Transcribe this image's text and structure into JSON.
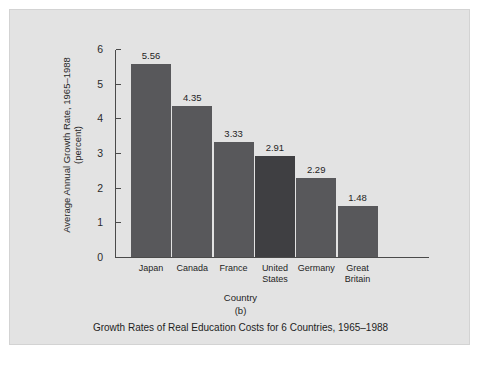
{
  "figure": {
    "panel_letter": "(b)",
    "caption": "Growth Rates of Real Education Costs for 6 Countries, 1965–1988",
    "background_color": "#e3e3e3",
    "page_color": "#ffffff"
  },
  "chart_data": {
    "type": "bar",
    "title": "Growth Rates of Real Education Costs for 6 Countries, 1965–1988",
    "subtitle": "(b)",
    "xlabel": "Country",
    "ylabel": "Average Annual Growth Rate, 1965–1988 (percent)",
    "ylabel_line1": "Average Annual Growth Rate, 1965–1988",
    "ylabel_line2": "(percent)",
    "categories": [
      "Japan",
      "Canada",
      "France",
      "United States",
      "Germany",
      "Great Britain"
    ],
    "values": [
      5.56,
      4.35,
      3.33,
      2.91,
      2.29,
      1.48
    ],
    "value_labels": [
      "5.56",
      "4.35",
      "3.33",
      "2.91",
      "2.29",
      "1.48"
    ],
    "category_lines": [
      [
        "Japan"
      ],
      [
        "Canada"
      ],
      [
        "France"
      ],
      [
        "United",
        "States"
      ],
      [
        "Germany"
      ],
      [
        "Great",
        "Britain"
      ]
    ],
    "ylim": [
      0,
      6
    ],
    "yticks": [
      0,
      1,
      2,
      3,
      4,
      5,
      6
    ],
    "ytick_labels": [
      "0",
      "1",
      "2",
      "3",
      "4",
      "5",
      "6"
    ],
    "grid": false,
    "legend": null,
    "bar_color": "#58585b",
    "highlight_bar_color": "#3f3f42",
    "highlight_category": "United States",
    "axis_color": "#4a4a4a"
  }
}
